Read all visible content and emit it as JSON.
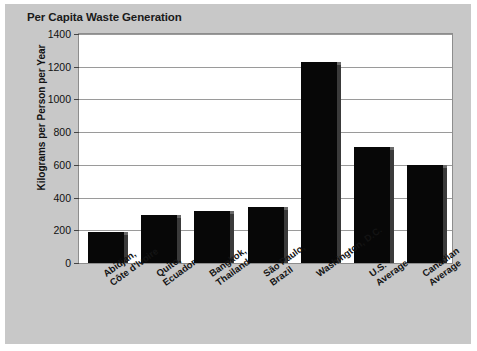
{
  "chart_data": {
    "type": "bar",
    "title": "Per Capita Waste Generation",
    "xlabel": "",
    "ylabel": "Kilograms per Person per Year",
    "ylim": [
      0,
      1400
    ],
    "ytick_step": 200,
    "yticks": [
      "1400",
      "1200",
      "1000",
      "800",
      "600",
      "400",
      "200",
      "0"
    ],
    "grid": true,
    "legend": "none",
    "bar_color": "#070707",
    "plot_background": "#ffffff",
    "figure_background": "#c8c8c8",
    "categories": [
      "Abidjan, Côte d'Ivoire",
      "Quito, Ecuador",
      "Bangkok, Thailand",
      "São Paulo, Brazil",
      "Washington, D.C.",
      "U.S. Average",
      "Canadian Average"
    ],
    "category_lines": [
      [
        "Abidjan,",
        "Côte d'Ivoire"
      ],
      [
        "Quito,",
        "Ecuador"
      ],
      [
        "Bangkok,",
        "Thailand"
      ],
      [
        "São Paulo,",
        "Brazil"
      ],
      [
        "Washington, D.C."
      ],
      [
        "U.S.",
        "Average"
      ],
      [
        "Canadian",
        "Average"
      ]
    ],
    "values": [
      190,
      295,
      320,
      340,
      1230,
      710,
      600
    ]
  }
}
